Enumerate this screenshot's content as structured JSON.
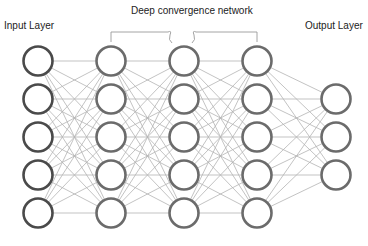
{
  "labels": {
    "input": "Input Layer",
    "title": "Deep convergence network",
    "output": "Output Layer"
  },
  "network": {
    "layers": [
      {
        "name": "input",
        "nodes": 5
      },
      {
        "name": "hidden-1",
        "nodes": 5
      },
      {
        "name": "hidden-2",
        "nodes": 5
      },
      {
        "name": "hidden-3",
        "nodes": 5
      },
      {
        "name": "output",
        "nodes": 3
      }
    ],
    "connections": "fully-connected",
    "colors": {
      "node_stroke": "#6b6b6b",
      "input_node_stroke": "#4a4a4a",
      "edge": "#b4b4b4",
      "bracket": "#9a9a9a"
    }
  }
}
